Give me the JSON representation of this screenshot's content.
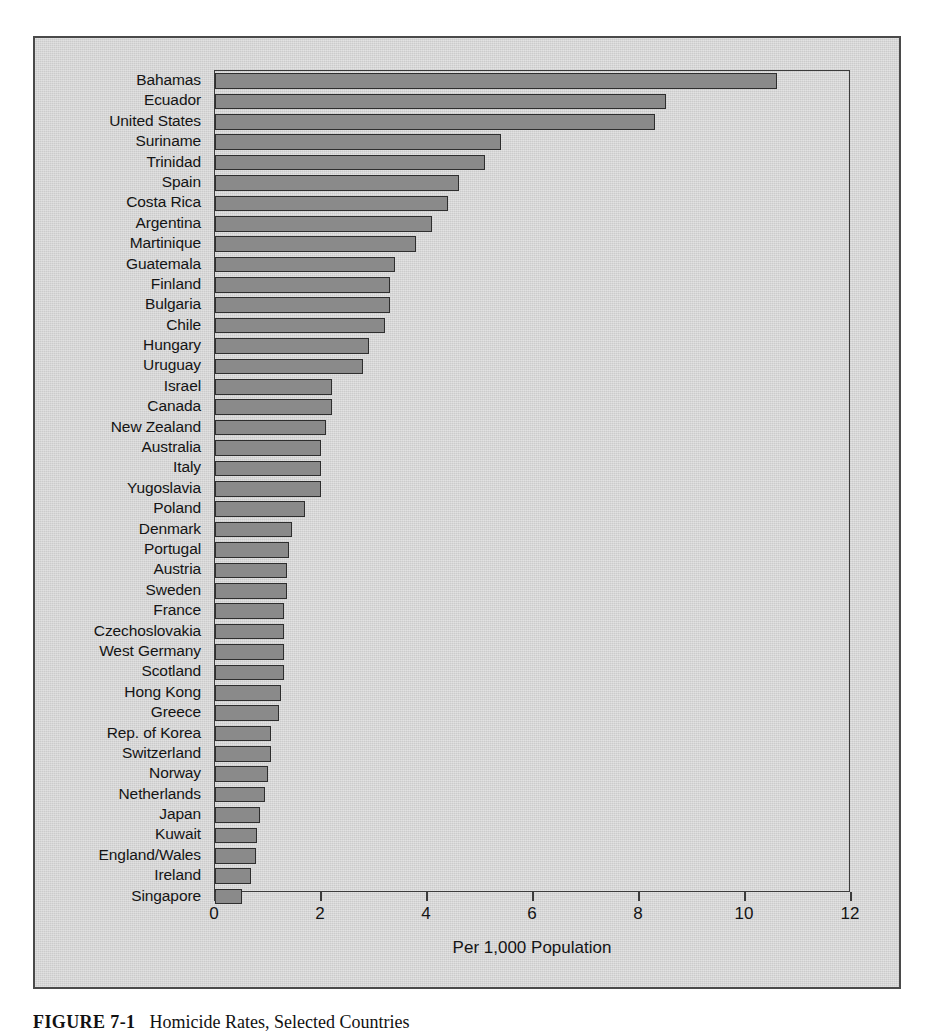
{
  "figure": {
    "caption_label": "FIGURE 7-1",
    "caption_text": "Homicide Rates, Selected Countries"
  },
  "chart_data": {
    "type": "bar",
    "orientation": "horizontal",
    "title": "",
    "subtitle": "",
    "xlabel": "Per 1,000 Population",
    "ylabel": "",
    "xlim": [
      0,
      12
    ],
    "xticks": [
      0,
      2,
      4,
      6,
      8,
      10,
      12
    ],
    "xtick_labels": [
      "0",
      "2",
      "4",
      "6",
      "8",
      "10",
      "12"
    ],
    "grid": false,
    "legend": null,
    "bar_color": "#8a8a8a",
    "bar_edge_color": "#2e2e2e",
    "panel_color": "#d4d4d4",
    "categories": [
      "Bahamas",
      "Ecuador",
      "United States",
      "Suriname",
      "Trinidad",
      "Spain",
      "Costa Rica",
      "Argentina",
      "Martinique",
      "Guatemala",
      "Finland",
      "Bulgaria",
      "Chile",
      "Hungary",
      "Uruguay",
      "Israel",
      "Canada",
      "New Zealand",
      "Australia",
      "Italy",
      "Yugoslavia",
      "Poland",
      "Denmark",
      "Portugal",
      "Austria",
      "Sweden",
      "France",
      "Czechoslovakia",
      "West Germany",
      "Scotland",
      "Hong Kong",
      "Greece",
      "Rep. of Korea",
      "Switzerland",
      "Norway",
      "Netherlands",
      "Japan",
      "Kuwait",
      "England/Wales",
      "Ireland",
      "Singapore"
    ],
    "values": [
      10.6,
      8.5,
      8.3,
      5.4,
      5.1,
      4.6,
      4.4,
      4.1,
      3.8,
      3.4,
      3.3,
      3.3,
      3.2,
      2.9,
      2.8,
      2.2,
      2.2,
      2.1,
      2.0,
      2.0,
      2.0,
      1.7,
      1.45,
      1.4,
      1.35,
      1.35,
      1.3,
      1.3,
      1.3,
      1.3,
      1.25,
      1.2,
      1.05,
      1.05,
      1.0,
      0.95,
      0.85,
      0.8,
      0.78,
      0.68,
      0.5
    ]
  }
}
